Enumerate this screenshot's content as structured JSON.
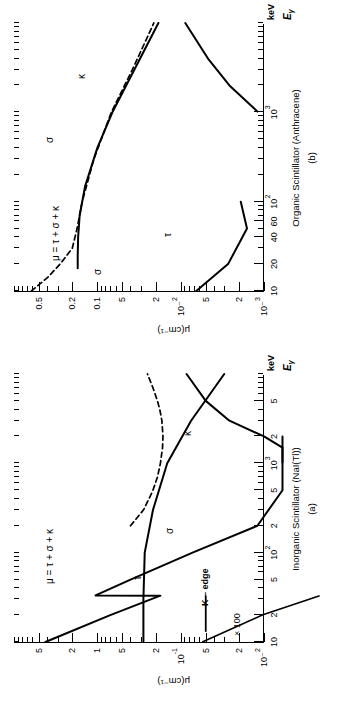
{
  "figure": {
    "orientation": "rotated-90-ccw",
    "ylabel": "μ(cm⁻¹)",
    "xlabel_energy": "E",
    "xlabel_energy_sub": "γ",
    "xlabel_units": "keV",
    "ink_color": "#000000",
    "background": "#ffffff"
  },
  "panels": [
    {
      "id": "a",
      "letter": "(a)",
      "title": "Inorganic Scintillator (NaI(Tl))",
      "xticks_major": [
        {
          "v": 10,
          "label": "10"
        },
        {
          "v": 20,
          "label": "2"
        },
        {
          "v": 50,
          "label": "5"
        },
        {
          "v": 100,
          "label": "10²"
        },
        {
          "v": 200,
          "label": "2"
        },
        {
          "v": 500,
          "label": "5"
        },
        {
          "v": 1000,
          "label": "10³"
        },
        {
          "v": 2000,
          "label": "2"
        },
        {
          "v": 5000,
          "label": "5"
        }
      ],
      "xrange": [
        10,
        10000
      ],
      "yticks_major": [
        {
          "v": 0.01,
          "label": "10⁻²"
        },
        {
          "v": 0.02,
          "label": "2"
        },
        {
          "v": 0.05,
          "label": "5"
        },
        {
          "v": 0.1,
          "label": "10⁻¹"
        },
        {
          "v": 0.2,
          "label": "2"
        },
        {
          "v": 0.5,
          "label": "5"
        },
        {
          "v": 1,
          "label": "1"
        },
        {
          "v": 2,
          "label": "2"
        },
        {
          "v": 5,
          "label": "5"
        }
      ],
      "yrange": [
        0.01,
        10
      ],
      "annotations": [
        {
          "name": "mu-sum-label",
          "text": "μ = τ + σ + κ"
        },
        {
          "name": "tau-label",
          "text": "τ"
        },
        {
          "name": "sigma-label",
          "text": "σ"
        },
        {
          "name": "kappa-label",
          "text": "κ"
        },
        {
          "name": "k-edge-label",
          "text": "K – edge"
        },
        {
          "name": "times-100-label",
          "text": "× 100"
        }
      ]
    },
    {
      "id": "b",
      "letter": "(b)",
      "title": "Organic Scintillator (Anthracene)",
      "xticks_major": [
        {
          "v": 10,
          "label": "10"
        },
        {
          "v": 20,
          "label": "20"
        },
        {
          "v": 40,
          "label": "40"
        },
        {
          "v": 60,
          "label": "60"
        },
        {
          "v": 100,
          "label": "10²"
        },
        {
          "v": 1000,
          "label": "10³"
        }
      ],
      "xrange": [
        10,
        10000
      ],
      "yticks_major": [
        {
          "v": 0.001,
          "label": "10⁻³"
        },
        {
          "v": 0.002,
          "label": "2"
        },
        {
          "v": 0.005,
          "label": "5"
        },
        {
          "v": 0.01,
          "label": "10⁻²"
        },
        {
          "v": 0.02,
          "label": "2"
        },
        {
          "v": 0.05,
          "label": "5"
        },
        {
          "v": 0.1,
          "label": "0.1"
        },
        {
          "v": 0.2,
          "label": "0.2"
        },
        {
          "v": 0.5,
          "label": "0.5"
        }
      ],
      "yrange": [
        0.001,
        1.0
      ],
      "annotations": [
        {
          "name": "mu-sum-label",
          "text": "μ = τ + σ + κ"
        },
        {
          "name": "tau-label",
          "text": "τ"
        },
        {
          "name": "sigma-label-upper",
          "text": "σ"
        },
        {
          "name": "sigma-label-lower",
          "text": "σ"
        },
        {
          "name": "kappa-label",
          "text": "κ"
        }
      ]
    }
  ],
  "chart_data": [
    {
      "type": "line",
      "id": "panel-a",
      "title": "Inorganic Scintillator (NaI(Tl))",
      "xlabel": "Eγ (keV)",
      "ylabel": "μ(cm⁻¹)",
      "xscale": "log",
      "yscale": "log",
      "xlim": [
        10,
        10000
      ],
      "ylim": [
        0.01,
        10
      ],
      "grid": false,
      "legend": "inline-curve-labels",
      "series": [
        {
          "name": "μ = τ + σ + κ (total, dashed)",
          "style": "dashed",
          "x": [
            200,
            300,
            400,
            500,
            700,
            1000,
            1500,
            2000,
            3000,
            4000,
            5000,
            7000,
            10000
          ],
          "y": [
            0.4,
            0.28,
            0.24,
            0.215,
            0.19,
            0.175,
            0.165,
            0.163,
            0.168,
            0.178,
            0.19,
            0.215,
            0.25
          ]
        },
        {
          "name": "τ (photoelectric, ×100 branch below K-edge)",
          "style": "solid",
          "x": [
            10,
            20,
            33,
            33.2,
            50,
            100,
            200,
            500,
            1000,
            2000
          ],
          "y": [
            4.2,
            0.7,
            0.175,
            1.05,
            0.4,
            0.072,
            0.012,
            0.00095,
            0.00019,
            3.8e-05
          ]
        },
        {
          "name": "σ (Compton)",
          "style": "solid",
          "x": [
            10,
            30,
            100,
            300,
            1000,
            3000,
            10000
          ],
          "y": [
            0.28,
            0.28,
            0.27,
            0.215,
            0.145,
            0.075,
            0.03
          ]
        },
        {
          "name": "κ (pair production)",
          "style": "solid",
          "x": [
            1022,
            1500,
            2000,
            3000,
            5000,
            10000
          ],
          "y": [
            0.0001,
            0.0035,
            0.01,
            0.026,
            0.05,
            0.085
          ]
        }
      ]
    },
    {
      "type": "line",
      "id": "panel-b",
      "title": "Organic Scintillator (Anthracene)",
      "xlabel": "Eγ (keV)",
      "ylabel": "μ(cm⁻¹)",
      "xscale": "log",
      "yscale": "log",
      "xlim": [
        10,
        10000
      ],
      "ylim": [
        0.001,
        1.0
      ],
      "grid": false,
      "legend": "inline-curve-labels",
      "series": [
        {
          "name": "μ = τ + σ + κ (total, dashed)",
          "style": "dashed",
          "x": [
            10,
            14,
            20,
            30,
            50,
            100,
            300,
            1000,
            3000,
            10000
          ],
          "y": [
            0.62,
            0.4,
            0.28,
            0.2,
            0.175,
            0.152,
            0.11,
            0.068,
            0.038,
            0.021
          ]
        },
        {
          "name": "σ (Compton)",
          "style": "solid",
          "x": [
            18,
            25,
            40,
            70,
            150,
            400,
            1000,
            3000,
            10000
          ],
          "y": [
            0.172,
            0.172,
            0.17,
            0.163,
            0.14,
            0.1,
            0.066,
            0.036,
            0.0185
          ]
        },
        {
          "name": "τ (photoelectric)",
          "style": "solid",
          "x": [
            10,
            20,
            50,
            100
          ],
          "y": [
            0.0065,
            0.0027,
            0.0016,
            0.0019
          ]
        },
        {
          "name": "κ (pair production)",
          "style": "solid",
          "x": [
            1022,
            2000,
            4000,
            10000
          ],
          "y": [
            0.0012,
            0.0026,
            0.0047,
            0.0088
          ]
        }
      ]
    }
  ]
}
